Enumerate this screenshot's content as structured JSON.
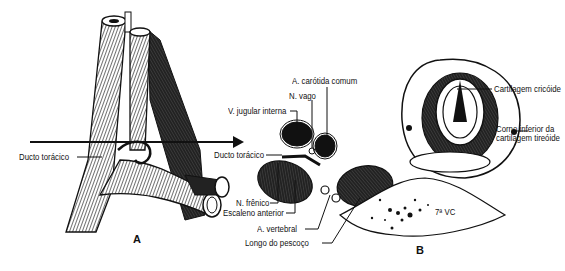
{
  "figure": {
    "panel_a": {
      "letter": "A",
      "labels": {
        "thoracic_duct": "Ducto torácico"
      }
    },
    "panel_b": {
      "letter": "B",
      "labels": {
        "common_carotid": "A. carótida comum",
        "vagus": "N. vago",
        "internal_jugular": "V. jugular interna",
        "thoracic_duct": "Ducto torácico",
        "phrenic": "N. frênico",
        "scalene_anterior": "Escaleno anterior",
        "vertebral_artery": "A. vertebral",
        "longus_colli": "Longo do pescoço",
        "cricoid": "Cartilagem cricóide",
        "thyroid_horn_1": "Corno inferior da",
        "thyroid_horn_2": "cartilagem tireóide",
        "vertebra": "7ª VC"
      }
    }
  }
}
